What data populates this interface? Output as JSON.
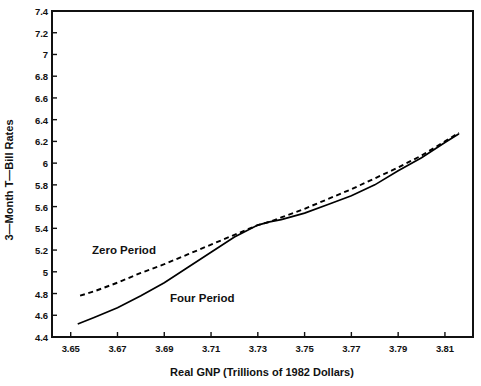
{
  "chart_data": {
    "type": "line",
    "title": "",
    "xlabel": "Real GNP (Trillions of 1982 Dollars)",
    "ylabel": "3—Month T—Bill Rates",
    "xlim": [
      3.642,
      3.822
    ],
    "ylim": [
      4.4,
      7.4
    ],
    "grid": false,
    "legend_position": "inline-annotations",
    "xticks": [
      "3.65",
      "3.67",
      "3.69",
      "3.71",
      "3.73",
      "3.75",
      "3.77",
      "3.79",
      "3.81"
    ],
    "xtick_values": [
      3.65,
      3.67,
      3.69,
      3.71,
      3.73,
      3.75,
      3.77,
      3.79,
      3.81
    ],
    "yticks": [
      "7.4",
      "7.2",
      "7",
      "6.8",
      "6.6",
      "6.4",
      "6.2",
      "6",
      "5.8",
      "5.6",
      "5.4",
      "5.2",
      "5",
      "4.8",
      "4.6",
      "4.4"
    ],
    "ytick_values": [
      7.4,
      7.2,
      7.0,
      6.8,
      6.6,
      6.4,
      6.2,
      6.0,
      5.8,
      5.6,
      5.4,
      5.2,
      5.0,
      4.8,
      4.6,
      4.4
    ],
    "series": [
      {
        "name": "Zero Period",
        "style": "dashed",
        "color": "#000000",
        "annotation": "Zero Period",
        "points": [
          [
            3.654,
            4.78
          ],
          [
            3.66,
            4.82
          ],
          [
            3.67,
            4.9
          ],
          [
            3.68,
            4.99
          ],
          [
            3.69,
            5.07
          ],
          [
            3.7,
            5.16
          ],
          [
            3.71,
            5.25
          ],
          [
            3.72,
            5.34
          ],
          [
            3.73,
            5.43
          ],
          [
            3.735,
            5.46
          ],
          [
            3.74,
            5.5
          ],
          [
            3.75,
            5.58
          ],
          [
            3.76,
            5.67
          ],
          [
            3.77,
            5.76
          ],
          [
            3.78,
            5.86
          ],
          [
            3.79,
            5.96
          ],
          [
            3.8,
            6.07
          ],
          [
            3.81,
            6.2
          ],
          [
            3.816,
            6.28
          ]
        ]
      },
      {
        "name": "Four Period",
        "style": "solid",
        "color": "#000000",
        "annotation": "Four Period",
        "points": [
          [
            3.653,
            4.52
          ],
          [
            3.66,
            4.58
          ],
          [
            3.67,
            4.67
          ],
          [
            3.68,
            4.78
          ],
          [
            3.69,
            4.9
          ],
          [
            3.7,
            5.04
          ],
          [
            3.71,
            5.18
          ],
          [
            3.72,
            5.32
          ],
          [
            3.73,
            5.43
          ],
          [
            3.735,
            5.46
          ],
          [
            3.74,
            5.48
          ],
          [
            3.75,
            5.54
          ],
          [
            3.76,
            5.62
          ],
          [
            3.77,
            5.7
          ],
          [
            3.78,
            5.8
          ],
          [
            3.79,
            5.93
          ],
          [
            3.8,
            6.05
          ],
          [
            3.81,
            6.19
          ],
          [
            3.816,
            6.27
          ]
        ]
      }
    ]
  },
  "axes": {
    "x_title": "Real GNP (Trillions of 1982 Dollars)",
    "y_title": "3—Month T—Bill Rates"
  },
  "annotations": {
    "zero_period": "Zero Period",
    "four_period": "Four Period"
  }
}
